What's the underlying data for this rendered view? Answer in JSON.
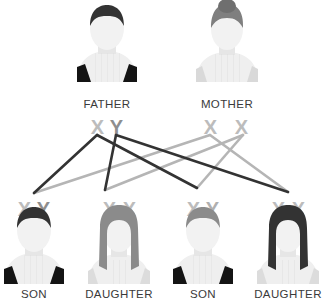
{
  "diagram": {
    "background_color": "#ffffff",
    "colors": {
      "paternal_line": "#333333",
      "maternal_line": "#b5b5b5",
      "chromosome_x_light": "#b9b9b9",
      "chromosome_y_dark": "#8e8e8e",
      "label_text": "#3a3a3a",
      "hair_dark": "#333333",
      "hair_mid": "#8b8b8b",
      "body_light": "#efefef",
      "body_shade": "#e4e4e4",
      "strap_dark": "#1a1a1a",
      "strap_light": "#d8d8d8"
    }
  },
  "parents": [
    {
      "id": "father",
      "label": "FATHER",
      "karyotype": "XY",
      "chromosomes": [
        "X",
        "Y"
      ],
      "hair": "dark",
      "top_style": "dark-tank",
      "cx": 107,
      "label_x": 107,
      "label_y": 108,
      "karyotype_x": 107,
      "karyotype_y": 128
    },
    {
      "id": "mother",
      "label": "MOTHER",
      "karyotype": "XX",
      "chromosomes": [
        "X",
        "X"
      ],
      "hair": "mid-bun",
      "top_style": "light-tank",
      "cx": 227,
      "label_x": 227,
      "label_y": 108,
      "karyotype_x": 227,
      "karyotype_y": 128
    }
  ],
  "children": [
    {
      "id": "son-1",
      "label": "SON",
      "karyotype": "XY",
      "chromosomes": [
        "X",
        "Y"
      ],
      "hair": "dark",
      "top_style": "dark-tank",
      "cx": 34,
      "karyotype_x": 34,
      "karyotype_y": 215,
      "label_x": 34,
      "label_y": 298
    },
    {
      "id": "daughter-1",
      "label": "DAUGHTER",
      "karyotype": "XX",
      "chromosomes": [
        "X",
        "X"
      ],
      "hair": "mid-long",
      "top_style": "light-tank",
      "cx": 119,
      "karyotype_x": 119,
      "karyotype_y": 215,
      "label_x": 119,
      "label_y": 298
    },
    {
      "id": "son-2",
      "label": "SON",
      "karyotype": "XY",
      "chromosomes": [
        "X",
        "Y"
      ],
      "hair": "mid",
      "top_style": "dark-tank",
      "cx": 203,
      "karyotype_x": 203,
      "karyotype_y": 215,
      "label_x": 203,
      "label_y": 298
    },
    {
      "id": "daughter-2",
      "label": "DAUGHTER",
      "karyotype": "XX",
      "chromosomes": [
        "X",
        "X"
      ],
      "hair": "dark-long",
      "top_style": "light-tank",
      "cx": 288,
      "karyotype_x": 288,
      "karyotype_y": 215,
      "label_x": 288,
      "label_y": 298
    }
  ],
  "inheritance_lines": [
    {
      "id": "father-x-to-son-1",
      "from": "father-X",
      "to": "son-1",
      "source": "paternal",
      "x1": 97,
      "y1": 135,
      "x2": 34,
      "y2": 193
    },
    {
      "id": "father-x-to-son-2",
      "from": "father-X",
      "to": "son-2",
      "source": "paternal",
      "x1": 97,
      "y1": 135,
      "x2": 197,
      "y2": 188
    },
    {
      "id": "father-y-to-daughter-1",
      "from": "father-Y",
      "to": "daughter-1",
      "source": "paternal",
      "x1": 116,
      "y1": 135,
      "x2": 105,
      "y2": 190
    },
    {
      "id": "father-y-to-daughter-2",
      "from": "father-Y",
      "to": "daughter-2",
      "source": "paternal",
      "x1": 116,
      "y1": 135,
      "x2": 288,
      "y2": 192
    },
    {
      "id": "mother-x1-to-son-1",
      "from": "mother-X1",
      "to": "son-1",
      "source": "maternal",
      "x1": 210,
      "y1": 135,
      "x2": 34,
      "y2": 193
    },
    {
      "id": "mother-x1-to-daughter-2",
      "from": "mother-X1",
      "to": "daughter-2",
      "source": "maternal",
      "x1": 210,
      "y1": 135,
      "x2": 288,
      "y2": 192
    },
    {
      "id": "mother-x2-to-daughter-1",
      "from": "mother-X2",
      "to": "daughter-1",
      "source": "maternal",
      "x1": 243,
      "y1": 135,
      "x2": 105,
      "y2": 190
    },
    {
      "id": "mother-x2-to-son-2",
      "from": "mother-X2",
      "to": "son-2",
      "source": "maternal",
      "x1": 243,
      "y1": 135,
      "x2": 197,
      "y2": 188
    }
  ]
}
